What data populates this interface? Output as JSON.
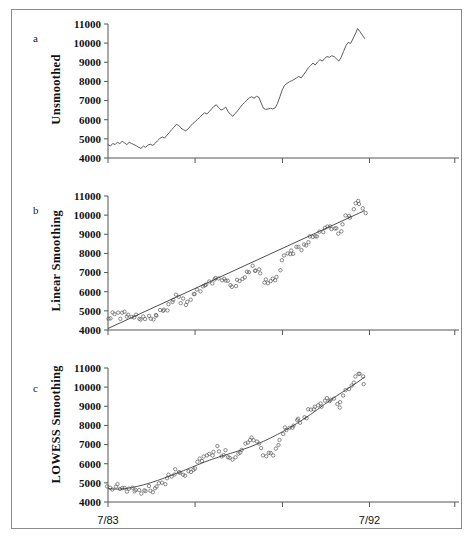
{
  "figure": {
    "panels": [
      {
        "letter": "a",
        "ylabel": "Unsmoothed",
        "render": "line"
      },
      {
        "letter": "b",
        "ylabel": "Linear Smoothing",
        "render": "scatter-linear"
      },
      {
        "letter": "c",
        "ylabel": "LOWESS Smoothing",
        "render": "scatter-lowess"
      }
    ],
    "xaxis": {
      "tick_labels": [
        "7/83",
        "7/92"
      ],
      "tick_label_positions": [
        0,
        0.745
      ],
      "ticks": [
        0,
        0.248,
        0.497,
        0.745,
        0.988
      ],
      "start": "7/83",
      "end": "7/92"
    },
    "yaxis": {
      "tick_labels": [
        "11000",
        "10000",
        "9000",
        "8000",
        "7000",
        "6000",
        "5000",
        "4000"
      ],
      "min": 4000,
      "max": 11000,
      "step": 1000
    },
    "colors": {
      "line": "#4a4a4a",
      "fit": "#3a3a3a",
      "marker": "#5a5a5a",
      "axis": "#555555",
      "frame": "#8a8a8a",
      "text": "#111111"
    }
  },
  "chart_data": {
    "type": "line",
    "title": "",
    "xlabel": "",
    "ylabel": "Unsmoothed / Linear Smoothing / LOWESS Smoothing",
    "ylim": [
      4000,
      11000
    ],
    "xlim": [
      "7/83",
      "7/92"
    ],
    "grid": false,
    "legend": "none",
    "x_tick_labels": [
      "7/83",
      "7/92"
    ],
    "y_tick_labels": [
      "4000",
      "5000",
      "6000",
      "7000",
      "8000",
      "9000",
      "10000",
      "11000"
    ],
    "n_points": 109,
    "series": [
      {
        "name": "Unsmoothed",
        "panel": "a",
        "values": [
          4700,
          4620,
          4760,
          4700,
          4830,
          4740,
          4880,
          4790,
          4700,
          4820,
          4760,
          4700,
          4640,
          4560,
          4500,
          4620,
          4560,
          4680,
          4720,
          4660,
          4760,
          4900,
          5020,
          5100,
          5040,
          5180,
          5320,
          5480,
          5600,
          5760,
          5700,
          5560,
          5480,
          5420,
          5520,
          5660,
          5800,
          5900,
          6020,
          6120,
          6260,
          6360,
          6300,
          6420,
          6560,
          6700,
          6780,
          6620,
          6500,
          6560,
          6660,
          6420,
          6280,
          6180,
          6320,
          6460,
          6620,
          6780,
          6900,
          7020,
          7140,
          7200,
          7120,
          7220,
          7180,
          6880,
          6600,
          6540,
          6560,
          6600,
          6560,
          6620,
          6860,
          7200,
          7560,
          7800,
          7900,
          7980,
          8040,
          8100,
          8180,
          8260,
          8180,
          8340,
          8520,
          8700,
          8820,
          8960,
          8860,
          9020,
          9140,
          9060,
          9200,
          9300,
          9260,
          9340,
          9300,
          9180,
          9060,
          9260,
          9560,
          9860,
          10040,
          9980,
          10220,
          10480,
          10760,
          10600,
          10420,
          10240
        ]
      },
      {
        "name": "Linear Smoothing",
        "panel": "b",
        "description": "Same observed points with a straight-line least-squares fit",
        "fit": {
          "type": "linear",
          "y_start": 4080,
          "y_end": 10240
        }
      },
      {
        "name": "LOWESS Smoothing",
        "panel": "c",
        "description": "Same observed points with a locally-weighted (LOWESS) smooth curve",
        "fit": {
          "type": "lowess",
          "y_start": 4560,
          "y_end": 10480
        }
      }
    ]
  }
}
